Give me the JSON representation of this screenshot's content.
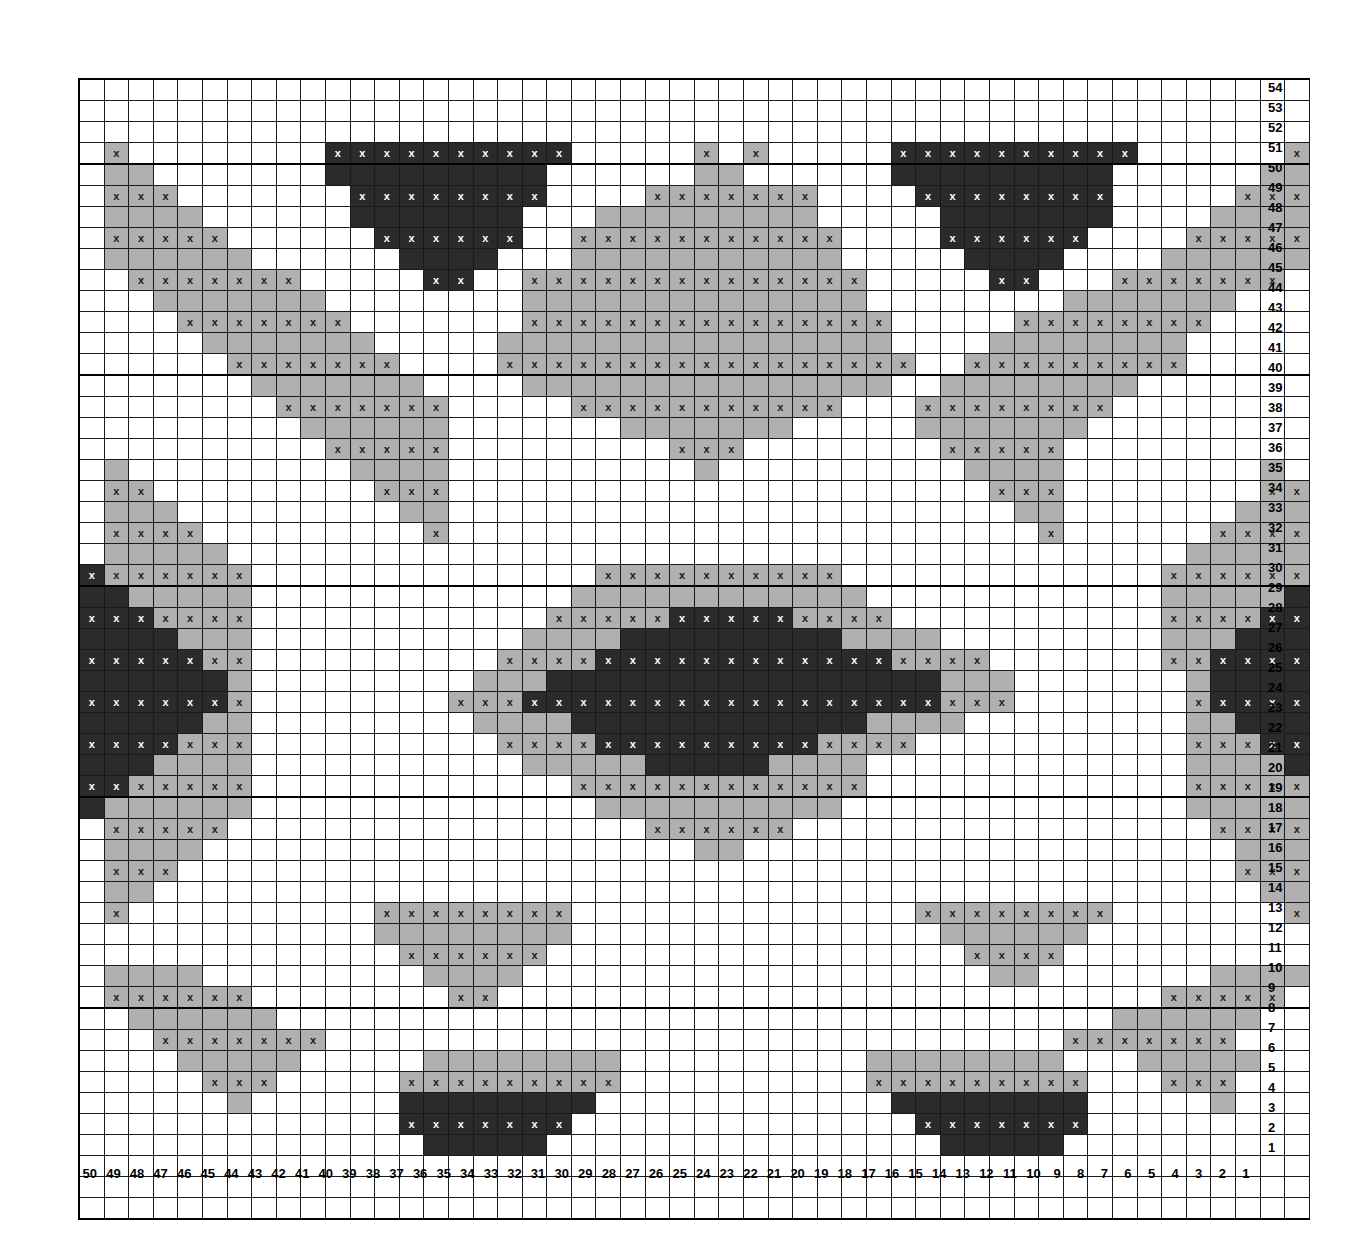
{
  "chart_data": {
    "type": "heatmap",
    "grid": {
      "columns": 50,
      "rows": 54
    },
    "xlabel": "Stitch number",
    "ylabel": "Row number",
    "col_label_order": "right-to-left (50 at left edge down to 1 at right edge)",
    "row_label_order": "top-to-bottom (54 at top down to 1 at bottom)",
    "column_labels": [
      50,
      49,
      48,
      47,
      46,
      45,
      44,
      43,
      42,
      41,
      40,
      39,
      38,
      37,
      36,
      35,
      34,
      33,
      32,
      31,
      30,
      29,
      28,
      27,
      26,
      25,
      24,
      23,
      22,
      21,
      20,
      19,
      18,
      17,
      16,
      15,
      14,
      13,
      12,
      11,
      10,
      9,
      8,
      7,
      6,
      5,
      4,
      3,
      2,
      1
    ],
    "row_labels": [
      54,
      53,
      52,
      51,
      50,
      49,
      48,
      47,
      46,
      45,
      44,
      43,
      42,
      41,
      40,
      39,
      38,
      37,
      36,
      35,
      34,
      33,
      32,
      31,
      30,
      29,
      28,
      27,
      26,
      25,
      24,
      23,
      22,
      21,
      20,
      19,
      18,
      17,
      16,
      15,
      14,
      13,
      12,
      11,
      10,
      9,
      8,
      7,
      6,
      5,
      4,
      3,
      2,
      1
    ],
    "legend": [
      {
        "key": "w",
        "name": "background",
        "color": "#ffffff",
        "symbol": ""
      },
      {
        "key": "g",
        "name": "light-gray-yarn",
        "color": "#b0b0b0",
        "symbol": "x"
      },
      {
        "key": "d",
        "name": "dark-yarn",
        "color": "#2b2b2b",
        "symbol": "x"
      }
    ],
    "symbol": "x",
    "symbol_rule": "an 'x' glyph is printed in every non-white cell on odd-numbered rows",
    "gridline_major_every": {
      "columns": 10,
      "rows": 10
    },
    "cells": [
      "wwwwwwwwwwwwwwwwwwwwwwwwwwwwwwwwwwwwwwwwwwwwwwwwww",
      "wwwwwwwwwwwwwwwwwwwwwwwwwwwwwwwwwwwwwwwwwwwwwwwwww",
      "wwwwwwwwwwwwwwwwwwwwwwwwwwwwwwwwwwwwwwwwwwwwwwwwww",
      "wgwwwwwwwwddddddddddwwwwwgwgwwwwwddddddddddwwwwwwgw",
      "wggwwwwwwwdddddddddwwwwwwggwwwwwwdddddddddwwwwwwggw",
      "wgggwwwwwwwddddddddwwwwgggggggwwwwddddddddwwwwwgggw",
      "wggggwwwwwwdddddddwwwgggggggggwwwwwdddddddwwwwggggw",
      "wgggggwwwwwwddddddwwgggggggggggwwwwddddddwwwwgggggw",
      "wggggggwwwwwwddddwwwgggggggggggwwwwwddddwwwwggggggw",
      "wwgggggggwwwwwddwwggggggggggggggwwwwwddwwwgggggggww",
      "wwwgggggggwwwwwwwwggggggggggggggwwwwwwwwgggggggwwww",
      "wwwwgggggggwwwwwwwgggggggggggggggwwwwwggggggggwwwww",
      "wwwwwgggggggwwwwwggggggggggggggggwwwwggggggggwwwwww",
      "wwwwwwgggggggwwwwgggggggggggggggggwwgggggggggwwwwww",
      "wwwwwwwgggggggwwwwgggggggggggggggwwggggggggwwwwwwww",
      "wwwwwwwwgggggggwwwwwgggggggggggwwwggggggggwwwwwwwww",
      "wwwwwwwwwggggggwwwwwwwgggggggwwwwwgggggggwwwwwwwwww",
      "wwwwwwwwwwgggggwwwwwwwwwgggwwwwwwwwgggggwwwwwwwwwww",
      "wgwwwwwwwwwggggwwwwwwwwwwgwwwwwwwwwwggggwwwwwwwwgww",
      "wggwwwwwwwwwgggwwwwwwwwwwwwwwwwwwwwwwgggwwwwwwwwggw",
      "wgggwwwwwwwwwggwwwwwwwwwwwwwwwwwwwwwwwggwwwwwwwgggw",
      "wggggwwwwwwwwwgwwwwwwwwwwwwwwwwwwwwwwwwgwwwwwwggggw",
      "wgggggwwwwwwwwwwwwwwwwwwwwwwwwwwwwwwwwwwwwwwwgggggw",
      "dggggggwwwwwwwwwwwwwwggggggggggwwwwwwwwwwwwwggggggd",
      "ddgggggwwwwwwwwwwwwwggggggggggggwwwwwwwwwwwwgggggdd",
      "dddggggwwwwwwwwwwwwgggggdddddggggwwwwwwwwwwwggggddd",
      "ddddgggwwwwwwwwwwwggggdddddddddggggwwwwwwwwwgggdddd",
      "dddddggwwwwwwwwwwggggddddddddddddggggwwwwwwwggddddd",
      "ddddddgwwwwwwwwwgggddddddddddddddddgggwwwwwwwgdddddd",
      "ddddddgwwwwwwwwgggdddddddddddddddddgggwwwwwwwgdddddd",
      "dddddggwwwwwwwwwggggddddddddddddggggwwwwwwwwwggddddd",
      "ddddgggwwwwwwwwwwggggdddddddddggggwwwwwwwwwwwgggdddd",
      "dddggggwwwwwwwwwwwgggggdddddggggwwwwwwwwwwwwwggggddd",
      "ddgggggwwwwwwwwwwwwwggggggggggggwwwwwwwwwwwwwgggggdd",
      "dggggggwwwwwwwwwwwwwwggggggggggwwwwwwwwwwwwwwggggggd",
      "wgggggwwwwwwwwwwwwwwwwwggggggwwwwwwwwwwwwwwwwwgggggw",
      "wggggwwwwwwwwwwwwwwwwwwwwggwwwwwwwwwwwwwwwwwwwwggggw",
      "wgggwwwwwwwwwwwwwwwwwwwwwwwwwwwwwwwwwwwwwwwwwwwgggw",
      "wggwwwwwwwwwwwwwwwwwwwwwwwwwwwwwwwwwwwwwwwwwwwwwggw",
      "wgwwwwwwwwwwggggggggwwwwwwwwwwwwwwggggggggwwwwwwwgw",
      "wwwwwwwwwwwwggggggggwwwwwwwwwwwwwwwggggggwwwwwwwwww",
      "wwwwwwwwwwwwwggggggwwwwwwwwwwwwwwwwwggggwwwwwwwwwww",
      "wggggwwwwwwwwwggggwwwwwwwwwwwwwwwwwwwggwwwwwwwggggw",
      "wggggggwwwwwwwwggwwwwwwwwwwwwwwwwwwwwwwwwwwwgggggww",
      "wwggggggwwwwwwwwwwwwwwwwwwwwwwwwwwwwwwwwwwggggggwww",
      "wwwgggggggwwwwwwwwwwwwwwwwwwwwwwwwwwwwwwgggggggwwww",
      "wwwwgggggwwwwwggggggggwwwwwwwwwwggggggggwwwgggggwww",
      "wwwwwgggwwwwwgggggggggwwwwwwwwwwgggggggggwwwgggwwww",
      "wwwwwwgwwwwwwddddddddwwwwwwwwwwwwddddddddwwwwwgwwww",
      "wwwwwwwwwwwwwdddddddwwwwwwwwwwwwwwdddddddwwwwwwwwww",
      "wwwwwwwwwwwwwwdddddwwwwwwwwwwwwwwwwdddddwwwwwwwwwww",
      "wwwwwwwwwwwwwwwwwwwwwwwwwwwwwwwwwwwwwwwwwwwwwwwwww",
      "wwwwwwwwwwwwwwwwwwwwwwwwwwwwwwwwwwwwwwwwwwwwwwwwww",
      "wwwwwwwwwwwwwwwwwwwwwwwwwwwwwwwwwwwwwwwwwwwwwwwwww"
    ]
  }
}
